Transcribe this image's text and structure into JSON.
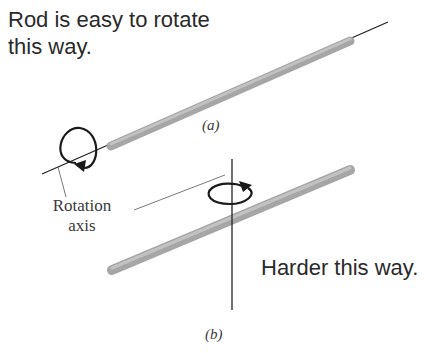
{
  "figure": {
    "part_a": {
      "annotation": "Rod is easy to rotate this way.",
      "annotation_line1": "Rod is easy to rotate",
      "annotation_line2": "this way.",
      "caption": "(a)"
    },
    "part_b": {
      "annotation": "Harder this way.",
      "caption": "(b)"
    },
    "axis_label_line1": "Rotation",
    "axis_label_line2": "axis",
    "colors": {
      "rod": "#a8a8a8",
      "rod_edge": "#8c8c8c",
      "axis_line": "#222222",
      "text": "#2a2a2a"
    }
  }
}
